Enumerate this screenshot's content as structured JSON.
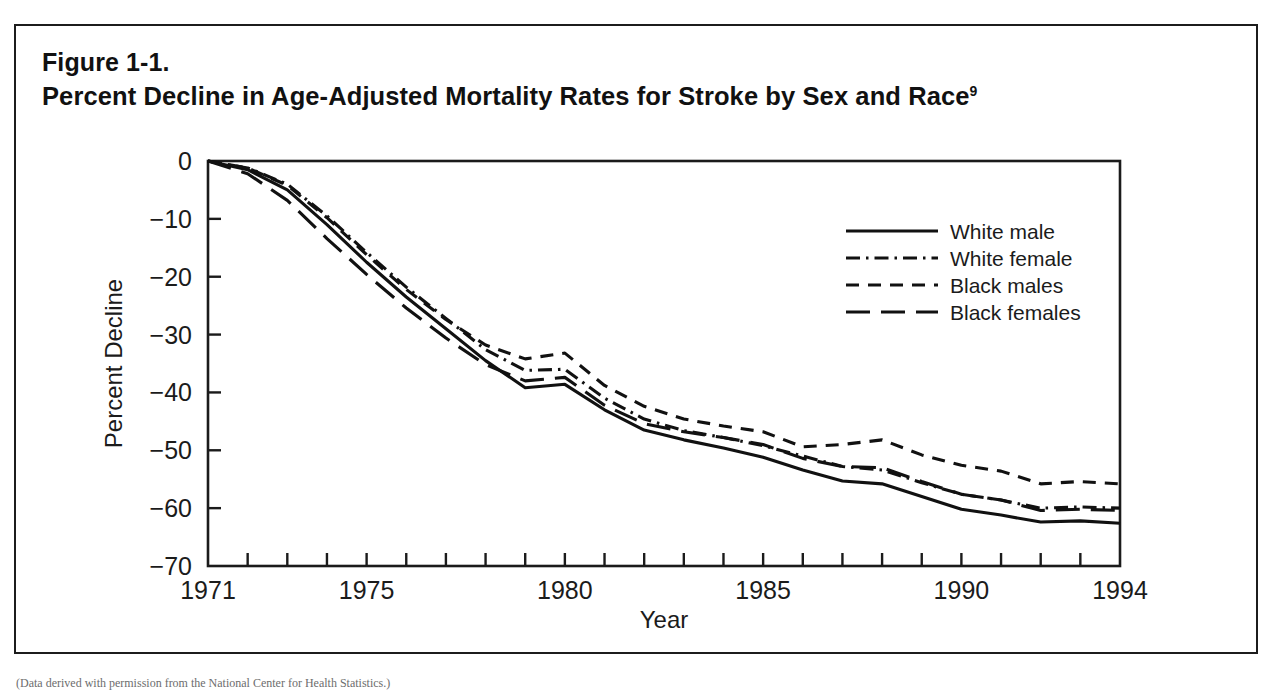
{
  "figure": {
    "number": "Figure 1-1.",
    "title": "Percent Decline in Age-Adjusted Mortality Rates for Stroke by Sex and Race",
    "title_superscript": "9"
  },
  "bottom_caption": "(Data derived with permission from the National Center for Health Statistics.)",
  "chart_data": {
    "type": "line",
    "title": "Percent Decline in Age-Adjusted Mortality Rates for Stroke by Sex and Race",
    "xlabel": "Year",
    "ylabel": "Percent Decline",
    "xlim": [
      1971,
      1994
    ],
    "ylim": [
      -70,
      0
    ],
    "grid": false,
    "legend_position": "upper-right",
    "x_tick_labels": [
      "1971",
      "1975",
      "1980",
      "1985",
      "1990",
      "1994"
    ],
    "x_tick_values": [
      1971,
      1975,
      1980,
      1985,
      1990,
      1994
    ],
    "x_minor_ticks": [
      1972,
      1973,
      1974,
      1976,
      1977,
      1978,
      1979,
      1981,
      1982,
      1983,
      1984,
      1986,
      1987,
      1988,
      1989,
      1991,
      1992,
      1993
    ],
    "y_tick_labels": [
      "0",
      "−10",
      "−20",
      "−30",
      "−40",
      "−50",
      "−60",
      "−70"
    ],
    "y_tick_values": [
      0,
      -10,
      -20,
      -30,
      -40,
      -50,
      -60,
      -70
    ],
    "x": [
      1971,
      1972,
      1973,
      1974,
      1975,
      1976,
      1977,
      1978,
      1979,
      1980,
      1981,
      1982,
      1983,
      1984,
      1985,
      1986,
      1987,
      1988,
      1989,
      1990,
      1991,
      1992,
      1993,
      1994
    ],
    "series": [
      {
        "name": "White male",
        "style": "solid",
        "values": [
          0,
          -1.5,
          -5.0,
          -11.0,
          -17.5,
          -23.5,
          -29.0,
          -34.5,
          -39.2,
          -38.6,
          -43.0,
          -46.5,
          -48.2,
          -49.6,
          -51.2,
          -53.4,
          -55.3,
          -55.8,
          -58.0,
          -60.2,
          -61.2,
          -62.4,
          -62.2,
          -62.6
        ]
      },
      {
        "name": "White female",
        "style": "dash-dot",
        "values": [
          0,
          -1.2,
          -4.0,
          -9.5,
          -15.8,
          -21.8,
          -27.2,
          -32.6,
          -36.2,
          -36.0,
          -41.0,
          -44.6,
          -46.6,
          -47.8,
          -49.2,
          -51.0,
          -52.8,
          -53.4,
          -55.6,
          -57.6,
          -58.6,
          -60.0,
          -59.8,
          -60.0
        ]
      },
      {
        "name": "Black males",
        "style": "short-dash",
        "values": [
          0,
          -1.2,
          -4.2,
          -9.8,
          -16.2,
          -22.2,
          -27.4,
          -31.8,
          -34.2,
          -33.2,
          -38.8,
          -42.4,
          -44.6,
          -45.8,
          -46.8,
          -49.4,
          -49.0,
          -48.2,
          -50.8,
          -52.6,
          -53.6,
          -55.8,
          -55.4,
          -55.8
        ]
      },
      {
        "name": "Black females",
        "style": "long-dash",
        "values": [
          0,
          -2.2,
          -6.8,
          -13.4,
          -19.6,
          -25.4,
          -30.6,
          -35.2,
          -38.0,
          -37.4,
          -42.2,
          -45.4,
          -46.8,
          -47.8,
          -49.0,
          -51.4,
          -52.8,
          -53.0,
          -55.4,
          -57.6,
          -58.6,
          -60.4,
          -60.2,
          -60.4
        ]
      }
    ]
  },
  "legend": [
    {
      "label": "White male",
      "style": "solid"
    },
    {
      "label": "White female",
      "style": "dash-dot"
    },
    {
      "label": "Black males",
      "style": "short-dash"
    },
    {
      "label": "Black females",
      "style": "long-dash"
    }
  ]
}
